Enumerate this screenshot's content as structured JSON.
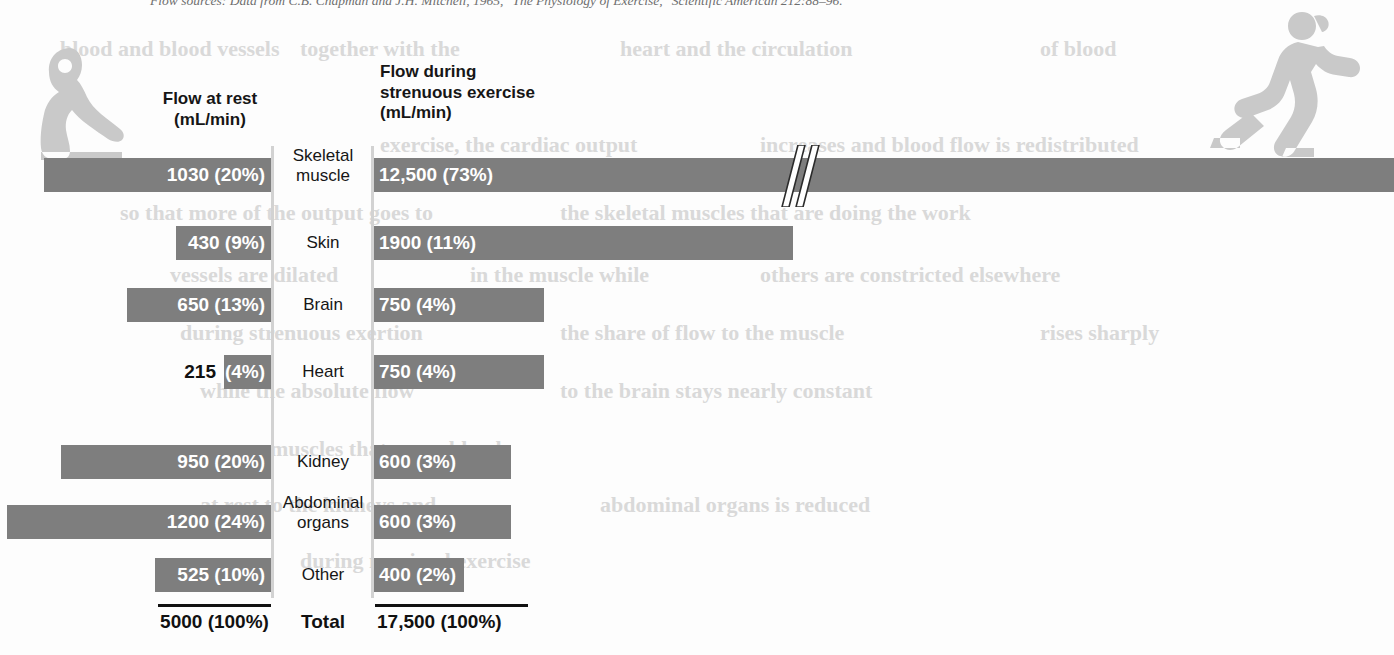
{
  "source_note": {
    "text": "Flow sources: Data from C.B. Chapman and J.H. Mitchell, 1965, \"The Physiology of Exercise,\" Scientific American 212:88–96."
  },
  "figures": {
    "rest_label": "resting-person-silhouette",
    "exercise_label": "running-person-silhouette"
  },
  "headers": {
    "rest": "Flow at rest\n(mL/min)",
    "exercise": "Flow during\nstrenuous exercise\n(mL/min)"
  },
  "colors": {
    "bar": "#7e7e7e",
    "axis": "#d2d2d2",
    "bar_label": "#ffffff",
    "text": "#161616",
    "silhouette": "#c9c9c9",
    "bleed_text": "#d9d9d9"
  },
  "totals": {
    "rest": "5000 (100%)",
    "label": "Total",
    "exercise": "17,500 (100%)"
  },
  "break_mark": {
    "name": "axis-break-double-slash",
    "x": 790
  },
  "chart_data": {
    "type": "bar",
    "xlabel": "",
    "ylabel": "",
    "orientation": "horizontal",
    "grid": false,
    "legend": "none",
    "note": "Two mirrored horizontal bar panels share the organ category axis in the centre. The top (Skeletal muscle) exercise bar is drawn with an axis break (//) because 12,500 mL/min exceeds the plotted scale.",
    "categories": [
      "Skeletal muscle",
      "Skin",
      "Brain",
      "Heart",
      "Kidney",
      "Abdominal organs",
      "Other"
    ],
    "series": [
      {
        "name": "Flow at rest (mL/min)",
        "units": "mL/min",
        "direction": "left",
        "values": [
          1030,
          430,
          650,
          215,
          950,
          1200,
          525
        ],
        "percents": [
          20,
          9,
          13,
          4,
          20,
          24,
          10
        ],
        "labels": [
          "1030 (20%)",
          "430 (9%)",
          "650 (13%)",
          "215 (4%)",
          "950 (20%)",
          "1200 (24%)",
          "525 (10%)"
        ],
        "total": 5000,
        "total_label": "5000 (100%)"
      },
      {
        "name": "Flow during strenuous exercise (mL/min)",
        "units": "mL/min",
        "direction": "right",
        "values": [
          12500,
          1900,
          750,
          750,
          600,
          600,
          400
        ],
        "percents": [
          73,
          11,
          4,
          4,
          3,
          3,
          2
        ],
        "labels": [
          "12,500 (73%)",
          "1900 (11%)",
          "750 (4%)",
          "750 (4%)",
          "600 (3%)",
          "600 (3%)",
          "400 (2%)"
        ],
        "total": 17500,
        "total_label": "17,500 (100%)",
        "axis_break_on_category": "Skeletal muscle"
      }
    ]
  },
  "rows": [
    {
      "organ": "Skeletal\nmuscle",
      "top": 158,
      "rest": {
        "label": "1030 (20%)",
        "left": 44,
        "width": 227,
        "label_inside": true
      },
      "exercise": {
        "label": "12,500 (73%)",
        "left": 374,
        "width": 1020,
        "label_inside": true
      }
    },
    {
      "organ": "Skin",
      "top": 226,
      "rest": {
        "label": "430 (9%)",
        "left": 176,
        "width": 95,
        "label_inside": true
      },
      "exercise": {
        "label": "1900 (11%)",
        "left": 374,
        "width": 419,
        "label_inside": true
      }
    },
    {
      "organ": "Brain",
      "top": 288,
      "rest": {
        "label": "650 (13%)",
        "left": 127,
        "width": 144,
        "label_inside": true
      },
      "exercise": {
        "label": "750 (4%)",
        "left": 374,
        "width": 170,
        "label_inside": true
      }
    },
    {
      "organ": "Heart",
      "top": 355,
      "rest": {
        "label": "(4%)",
        "outside_label": "215",
        "left": 224,
        "width": 47,
        "label_inside": false
      },
      "exercise": {
        "label": "750 (4%)",
        "left": 374,
        "width": 170,
        "label_inside": true
      }
    },
    {
      "organ": "Kidney",
      "top": 445,
      "rest": {
        "label": "950 (20%)",
        "left": 61,
        "width": 210,
        "label_inside": true
      },
      "exercise": {
        "label": "600 (3%)",
        "left": 374,
        "width": 137,
        "label_inside": true
      }
    },
    {
      "organ": "Abdominal\norgans",
      "top": 505,
      "rest": {
        "label": "1200 (24%)",
        "left": 7,
        "width": 264,
        "label_inside": true
      },
      "exercise": {
        "label": "600 (3%)",
        "left": 374,
        "width": 137,
        "label_inside": true
      }
    },
    {
      "organ": "Other",
      "top": 558,
      "rest": {
        "label": "525 (10%)",
        "left": 155,
        "width": 116,
        "label_inside": true
      },
      "exercise": {
        "label": "400 (2%)",
        "left": 374,
        "width": 90,
        "label_inside": true
      }
    }
  ],
  "bleed_through": [
    {
      "text": "blood and blood vessels",
      "left": 60,
      "top": 36,
      "size": 22
    },
    {
      "text": "together with the",
      "left": 300,
      "top": 36,
      "size": 22
    },
    {
      "text": "heart and the circulation",
      "left": 620,
      "top": 36,
      "size": 22
    },
    {
      "text": "of blood",
      "left": 1040,
      "top": 36,
      "size": 22
    },
    {
      "text": "exercise, the cardiac output",
      "left": 380,
      "top": 132,
      "size": 22
    },
    {
      "text": "increases and blood flow is redistributed",
      "left": 760,
      "top": 132,
      "size": 22
    },
    {
      "text": "so that more of the output goes to",
      "left": 120,
      "top": 200,
      "size": 22
    },
    {
      "text": "the skeletal muscles that are doing the work",
      "left": 560,
      "top": 200,
      "size": 22
    },
    {
      "text": "vessels are dilated",
      "left": 170,
      "top": 262,
      "size": 22
    },
    {
      "text": "in the muscle while",
      "left": 470,
      "top": 262,
      "size": 22
    },
    {
      "text": "others are constricted elsewhere",
      "left": 760,
      "top": 262,
      "size": 22
    },
    {
      "text": "during strenuous exertion",
      "left": 180,
      "top": 320,
      "size": 22
    },
    {
      "text": "the share of flow to the muscle",
      "left": 560,
      "top": 320,
      "size": 22
    },
    {
      "text": "rises sharply",
      "left": 1040,
      "top": 320,
      "size": 22
    },
    {
      "text": "while the absolute flow",
      "left": 200,
      "top": 378,
      "size": 22
    },
    {
      "text": "to the brain stays nearly constant",
      "left": 560,
      "top": 378,
      "size": 22
    },
    {
      "text": "muscles that carry blood",
      "left": 270,
      "top": 436,
      "size": 22
    },
    {
      "text": "at rest to the kidneys and",
      "left": 200,
      "top": 492,
      "size": 22
    },
    {
      "text": "abdominal organs is reduced",
      "left": 600,
      "top": 492,
      "size": 22
    },
    {
      "text": "during maximal exercise",
      "left": 300,
      "top": 548,
      "size": 22
    }
  ]
}
